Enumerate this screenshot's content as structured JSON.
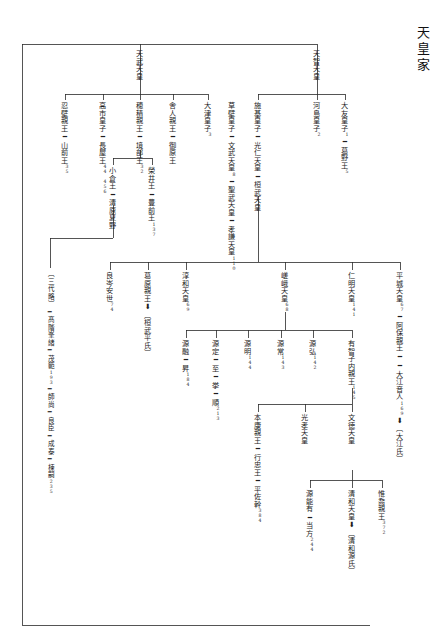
{
  "title": "天皇家",
  "nodes": {
    "tenmu": "天武天皇",
    "tenji": "天智天皇",
    "osakabe": "忍壁親王━山前王",
    "osakabe_num": "35",
    "takechi": "高市皇子━長屋王",
    "takechi_num": "44 456",
    "hozumi": "穂積親王━境部王",
    "hozumi_num": "32",
    "toneri": "舎人親王━御原王",
    "otsu": "大津皇子",
    "otsu_num": "3",
    "kusakabe": "草壁皇子━文武天皇",
    "kusakabe_num": "8",
    "shoumu": "━聖武天皇━孝謙天皇",
    "shoumu_num": "110",
    "shiki": "施基皇子━光仁天皇━桓武天皇",
    "kawashima": "河島皇子",
    "kawashima_num": "2",
    "otomo": "大友皇子",
    "otomo_num": "1",
    "kadono": "━葛野王",
    "kadono_num": "5",
    "ogura": "小倉王━清原夏野",
    "sakai": "榮井王━豊前王",
    "sakai_num": "137",
    "takashina": "〔三代略〕━髙階峯緒━茂範",
    "takashina_num": "193",
    "takashina2": "━師尚━良臣━成泰━棟嗣",
    "takashina2_num": "235",
    "yoshimine": "良岑安世",
    "yoshimine_num": "74",
    "kuzuhara": "葛原親王",
    "kuzuhara_arrow": "⬇",
    "kuzuhara_to": "〔桓武平氏〕",
    "junna": "淳和天皇",
    "junna_num": "69",
    "saga": "嵯峨天皇",
    "saga_num": "68",
    "minamoto_tooru": "源融",
    "minamoto_tooru_son": "━昇",
    "minamoto_tooru_num": "184",
    "minamoto_sadamu": "源定",
    "minamoto_sadamu_c1": "━至",
    "minamoto_sadamu_c2": "━挙",
    "minamoto_sadamu_c3": "━順",
    "minamoto_sadamu_num": "213",
    "minamoto_akira": "源明",
    "minamoto_akira_num": "144",
    "minamoto_tokiwa": "源常",
    "minamoto_tokiwa_num": "143",
    "minamoto_hiromu": "源弘",
    "minamoto_hiromu_num": "142",
    "uchiko": "有智子内親王",
    "uchiko_num": "145",
    "ninmyou": "仁明天皇",
    "ninmyou_num": "141",
    "heizei": "平城天皇",
    "heizei_num": "67",
    "abo": "━阿保親王━━大江音人",
    "abo_num": "169",
    "abo_arrow": "⬇",
    "abo_to": "〔大江氏〕",
    "motoyasu": "本康親王━行忠王━平佐幹",
    "motoyasu_num": "384",
    "kouko": "光孝天皇",
    "montoku": "文徳天皇",
    "minamoto_yoshiari": "源能有━当方",
    "minamoto_yoshiari_num": "244",
    "seiwa": "清和天皇",
    "seiwa_arrow": "⬇",
    "seiwa_to": "〔清和源氏〕",
    "koretaka": "惟喬親王",
    "koretaka_num": "372"
  }
}
